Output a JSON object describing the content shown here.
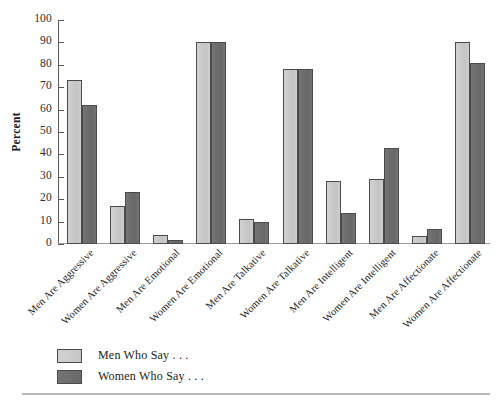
{
  "chart_data": {
    "type": "bar",
    "title": "",
    "xlabel": "",
    "ylabel": "Percent",
    "ylim": [
      0,
      100
    ],
    "yticks": [
      0,
      10,
      20,
      30,
      40,
      50,
      60,
      70,
      80,
      90,
      100
    ],
    "grid": false,
    "legend_position": "bottom-left",
    "categories": [
      "Men Are Aggressive",
      "Women Are Aggressive",
      "Men Are Emotional",
      "Women Are Emotional",
      "Men Are Talkative",
      "Women Are Talkative",
      "Men Are Intelligent",
      "Women Are Intelligent",
      "Men Are Affectionate",
      "Women Are Affectionate"
    ],
    "series": [
      {
        "name": "Men Who Say . . .",
        "color": "#c8c8c8",
        "values": [
          73,
          17,
          4,
          90,
          11,
          78,
          28,
          29,
          3.5,
          90
        ]
      },
      {
        "name": "Women Who Say . . .",
        "color": "#6e6e6e",
        "values": [
          62,
          23,
          2,
          90,
          10,
          78,
          14,
          43,
          6.5,
          81
        ]
      }
    ]
  },
  "axis": {
    "y_title": "Percent"
  },
  "legend": {
    "items": [
      {
        "label": "Men Who Say . . ."
      },
      {
        "label": "Women Who Say . . ."
      }
    ]
  }
}
